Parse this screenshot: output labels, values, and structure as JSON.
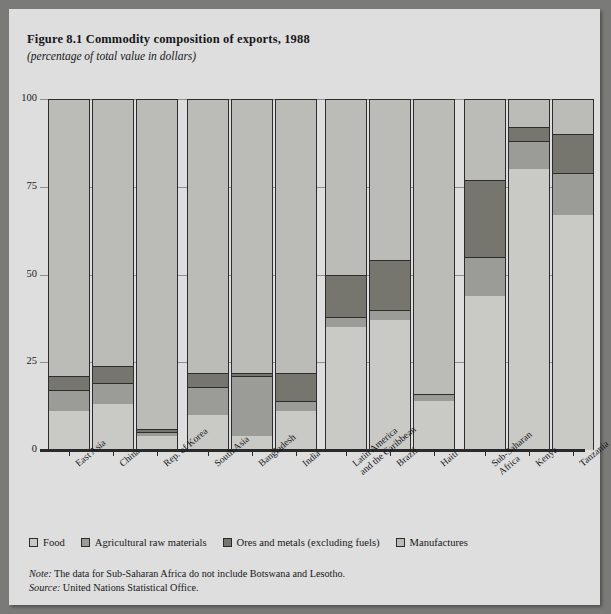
{
  "figure": {
    "title": "Figure 8.1  Commodity composition of exports, 1988",
    "subtitle": "(percentage of total value in dollars)",
    "note_label": "Note:",
    "note_text": " The data for Sub-Saharan Africa do not include Botswana and Lesotho.",
    "source_label": "Source:",
    "source_text": " United Nations Statistical Office."
  },
  "legend": {
    "items": [
      {
        "label": "Food",
        "color": "#c9c9c5"
      },
      {
        "label": "Agricultural raw materials",
        "color": "#9b9b97"
      },
      {
        "label": "Ores and metals (excluding fuels)",
        "color": "#76766f"
      },
      {
        "label": "Manufactures",
        "color": "#bbbbb7"
      }
    ]
  },
  "chart_data": {
    "type": "bar",
    "stacked": true,
    "title": "Figure 8.1  Commodity composition of exports, 1988",
    "subtitle": "(percentage of total value in dollars)",
    "xlabel": "",
    "ylabel": "",
    "ylim": [
      0,
      100
    ],
    "yticks": [
      0,
      25,
      50,
      75,
      100
    ],
    "grid": true,
    "legend_position": "bottom",
    "categories": [
      "East Asia",
      "China",
      "Rep. of Korea",
      "South Asia",
      "Bangladesh",
      "India",
      "Latin America and the Caribbean",
      "Brazil",
      "Haiti",
      "Sub-Saharan Africa",
      "Kenya",
      "Tanzania"
    ],
    "groups": [
      {
        "name": "East Asia",
        "members": [
          "East Asia",
          "China",
          "Rep. of Korea"
        ]
      },
      {
        "name": "South Asia",
        "members": [
          "South Asia",
          "Bangladesh",
          "India"
        ]
      },
      {
        "name": "Latin America",
        "members": [
          "Latin America and the Caribbean",
          "Brazil",
          "Haiti"
        ]
      },
      {
        "name": "Sub-Saharan Africa",
        "members": [
          "Sub-Saharan Africa",
          "Kenya",
          "Tanzania"
        ]
      }
    ],
    "series": [
      {
        "name": "Food",
        "color": "#c9c9c5",
        "values": [
          11,
          13,
          4,
          10,
          4,
          11,
          35,
          37,
          14,
          44,
          80,
          67
        ]
      },
      {
        "name": "Agricultural raw materials",
        "color": "#9b9b97",
        "values": [
          6,
          6,
          1,
          8,
          17,
          3,
          3,
          3,
          2,
          11,
          8,
          12
        ]
      },
      {
        "name": "Ores and metals (excluding fuels)",
        "color": "#76766f",
        "values": [
          4,
          5,
          1,
          4,
          1,
          8,
          12,
          14,
          0,
          22,
          4,
          11
        ]
      },
      {
        "name": "Manufactures",
        "color": "#bbbbb7",
        "values": [
          79,
          76,
          94,
          78,
          78,
          78,
          50,
          46,
          84,
          23,
          8,
          10
        ]
      }
    ]
  },
  "xticks": [
    "East Asia",
    "China",
    "Rep. of Korea",
    "South Asia",
    "Bangladesh",
    "India",
    "Latin America|and the Caribbean",
    "Brazil",
    "Haiti",
    "Sub-Saharan|Africa",
    "Kenya",
    "Tanzania"
  ]
}
